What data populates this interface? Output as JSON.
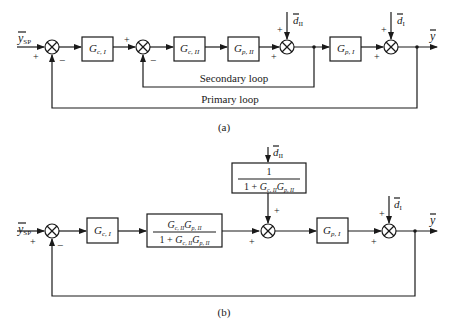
{
  "figure": {
    "panel_a": {
      "caption": "(a)",
      "input_label": "y",
      "input_subscript": "SP",
      "output_label": "y",
      "blocks": [
        {
          "id": "gc1",
          "main": "G",
          "sub": "c, I"
        },
        {
          "id": "gc2",
          "main": "G",
          "sub": "c, II"
        },
        {
          "id": "gp2",
          "main": "G",
          "sub": "p, II"
        },
        {
          "id": "gp1",
          "main": "G",
          "sub": "p, I"
        }
      ],
      "disturbances": [
        {
          "id": "d2",
          "main": "d",
          "sub": "II"
        },
        {
          "id": "d1",
          "main": "d",
          "sub": "I"
        }
      ],
      "signs": {
        "plus": "+",
        "minus": "−"
      },
      "loops": {
        "secondary": "Secondary loop",
        "primary": "Primary loop"
      }
    },
    "panel_b": {
      "caption": "(b)",
      "input_label": "y",
      "input_subscript": "SP",
      "output_label": "y",
      "blocks": [
        {
          "id": "gc1",
          "main": "G",
          "sub": "c, I"
        },
        {
          "id": "closed_loop",
          "numerator": "G_c,II G_p,II",
          "denominator": "1 + G_c,II G_p,II"
        },
        {
          "id": "disturbance_tf",
          "numerator": "1",
          "denominator": "1 + G_c,II G_p,II"
        },
        {
          "id": "gp1",
          "main": "G",
          "sub": "p, I"
        }
      ],
      "frac_parts": {
        "one": "1",
        "one_plus": "1 + ",
        "G": "G",
        "c2": "c, II",
        "p2": "p, II"
      },
      "disturbances": [
        {
          "id": "d2",
          "main": "d",
          "sub": "II"
        },
        {
          "id": "d1",
          "main": "d",
          "sub": "I"
        }
      ],
      "signs": {
        "plus": "+",
        "minus": "−"
      }
    }
  }
}
